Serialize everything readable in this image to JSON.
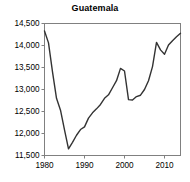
{
  "chart_data": {
    "type": "line",
    "title": "Guatemala",
    "xlabel": "",
    "ylabel": "",
    "xlim": [
      1980,
      2014
    ],
    "ylim": [
      11500,
      14500
    ],
    "grid": false,
    "legend": false,
    "legend_position": "none",
    "ytick_labels": [
      "14,500",
      "14,000",
      "13,500",
      "13,000",
      "12,500",
      "12,000",
      "11,500"
    ],
    "ytick_values": [
      14500,
      14000,
      13500,
      13000,
      12500,
      12000,
      11500
    ],
    "xtick_labels": [
      "1980",
      "1990",
      "2000",
      "2010"
    ],
    "xtick_values": [
      1980,
      1990,
      2000,
      2010
    ],
    "line_color": "#333333",
    "axis_color": "#808080",
    "series": [
      {
        "name": "Guatemala",
        "x": [
          1980,
          1981,
          1982,
          1983,
          1984,
          1985,
          1986,
          1987,
          1988,
          1989,
          1990,
          1991,
          1992,
          1993,
          1994,
          1995,
          1996,
          1997,
          1998,
          1999,
          2000,
          2001,
          2002,
          2003,
          2004,
          2005,
          2006,
          2007,
          2008,
          2009,
          2010,
          2011,
          2012,
          2013,
          2014
        ],
        "values": [
          14330,
          14060,
          13400,
          12800,
          12530,
          12080,
          11650,
          11800,
          11960,
          12090,
          12150,
          12350,
          12470,
          12560,
          12660,
          12800,
          12880,
          13040,
          13200,
          13480,
          13420,
          12770,
          12760,
          12840,
          12870,
          13000,
          13200,
          13520,
          14070,
          13900,
          13800,
          14010,
          14110,
          14200,
          14280
        ]
      }
    ]
  }
}
